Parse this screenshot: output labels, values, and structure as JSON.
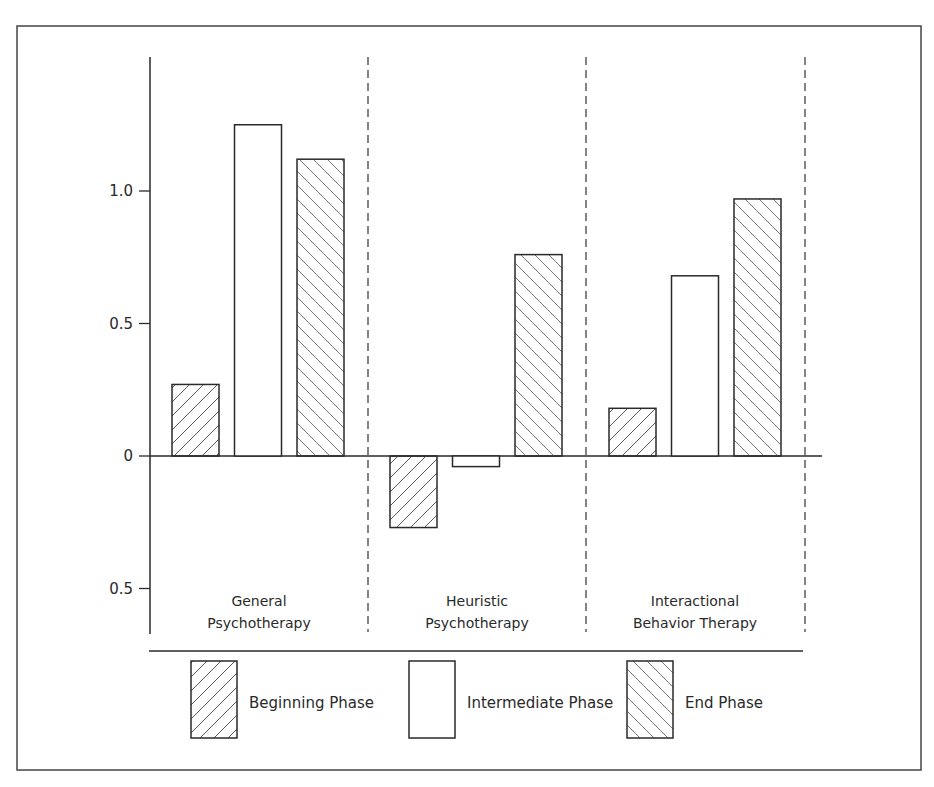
{
  "chart_data": {
    "type": "bar",
    "title": "",
    "xlabel": "",
    "ylabel": "",
    "ylim": [
      -0.6,
      1.5
    ],
    "yticks": [
      {
        "value": 1.0,
        "label": "1.0"
      },
      {
        "value": 0.5,
        "label": "0.5"
      },
      {
        "value": 0,
        "label": "0"
      },
      {
        "value": -0.5,
        "label": "0.5"
      }
    ],
    "grid": false,
    "legend_position": "bottom",
    "categories": [
      {
        "line1": "General",
        "line2": "Psychotherapy"
      },
      {
        "line1": "Heuristic",
        "line2": "Psychotherapy"
      },
      {
        "line1": "Interactional",
        "line2": "Behavior Therapy"
      }
    ],
    "series": [
      {
        "name": "Beginning Phase",
        "pattern": "hatch-forward",
        "values": [
          0.27,
          -0.27,
          0.18
        ]
      },
      {
        "name": "Intermediate Phase",
        "pattern": "none",
        "values": [
          1.25,
          -0.04,
          0.68
        ]
      },
      {
        "name": "End Phase",
        "pattern": "hatch-backward",
        "values": [
          1.12,
          0.76,
          0.97
        ]
      }
    ],
    "colors": {
      "stroke": "#2a2a2a",
      "hatch": "#555555",
      "background": "#ffffff"
    }
  }
}
